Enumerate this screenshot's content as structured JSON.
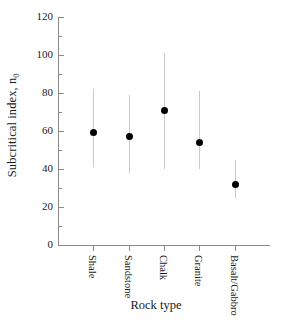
{
  "chart_data": {
    "type": "scatter",
    "title": "",
    "xlabel": "Rock type",
    "ylabel": "Subcritical index, n",
    "ylabel_subscript": "0",
    "ylim": [
      0,
      120
    ],
    "ytick_labels": [
      "0",
      "20",
      "40",
      "60",
      "80",
      "100",
      "120"
    ],
    "ytick_values": [
      0,
      20,
      40,
      60,
      80,
      100,
      120
    ],
    "yminor_step": 10,
    "grid": false,
    "legend": "none",
    "marker_color": "#000000",
    "errorbar_color": "#c9c9c9",
    "axis_color": "#8a8a8a",
    "categories": [
      "Shale",
      "Sandstone",
      "Chalk",
      "Granite",
      "Basalt/Gabbro"
    ],
    "values": [
      59,
      57,
      71,
      54,
      32
    ],
    "error_low": [
      41,
      38,
      40,
      40,
      25
    ],
    "error_high": [
      82,
      79,
      101,
      81,
      45
    ],
    "points": [
      {
        "category": "Shale",
        "value": 59,
        "low": 41,
        "high": 82
      },
      {
        "category": "Sandstone",
        "value": 57,
        "low": 38,
        "high": 79
      },
      {
        "category": "Chalk",
        "value": 71,
        "low": 40,
        "high": 101
      },
      {
        "category": "Granite",
        "value": 54,
        "low": 40,
        "high": 81
      },
      {
        "category": "Basalt/Gabbro",
        "value": 32,
        "low": 25,
        "high": 45
      }
    ]
  }
}
